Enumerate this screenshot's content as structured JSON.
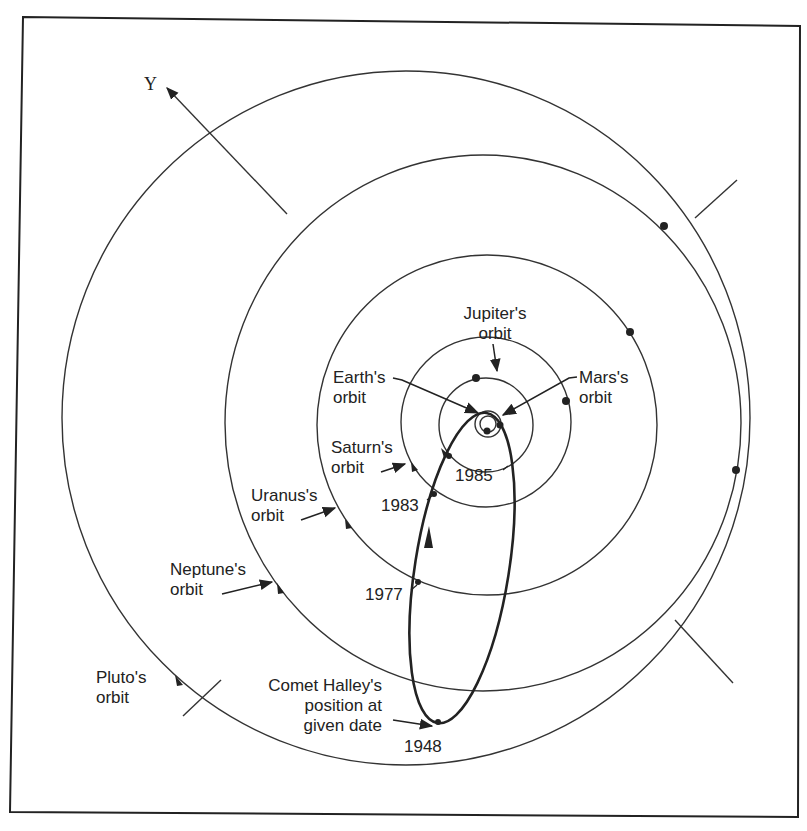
{
  "figure": {
    "axis_label": "Υ",
    "labels": {
      "jupiter": [
        "Jupiter's",
        "orbit"
      ],
      "earth": [
        "Earth's",
        "orbit"
      ],
      "mars": [
        "Mars's",
        "orbit"
      ],
      "saturn": [
        "Saturn's",
        "orbit"
      ],
      "uranus": [
        "Uranus's",
        "orbit"
      ],
      "neptune": [
        "Neptune's",
        "orbit"
      ],
      "pluto": [
        "Pluto's",
        "orbit"
      ],
      "comet": [
        "Comet Halley's",
        "position at",
        "given date"
      ]
    },
    "years": {
      "y1985": "1985",
      "y1983": "1983",
      "y1977": "1977",
      "y1948": "1948"
    },
    "orbits": [
      "Earth",
      "Mars",
      "Jupiter",
      "Saturn",
      "Uranus",
      "Neptune",
      "Pluto",
      "Comet Halley"
    ],
    "colors": {
      "line": "#222222",
      "background": "#ffffff"
    }
  }
}
